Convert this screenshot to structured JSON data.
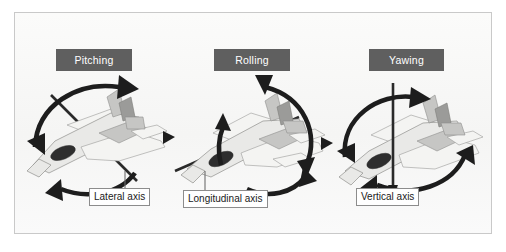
{
  "figure": {
    "kind": "aircraft-rotation-axes-diagram",
    "background_color": "#f7f7f6",
    "frame_border_color": "#c9c9c9",
    "title_box_color": "#5f5f5f",
    "title_text_color": "#ffffff",
    "arrow_color": "#1d1d1d",
    "caption_border_color": "#8c8c8c",
    "aircraft_fill": "#e9e9e7",
    "aircraft_shade": "#c6c6c4"
  },
  "panels": [
    {
      "id": "pitching",
      "title": "Pitching",
      "axis_caption": "Lateral axis",
      "aircraft_icon": "fighter-jet-icon",
      "rotation_arrows": 2,
      "axis_orientation": "lateral-wingtip-to-wingtip"
    },
    {
      "id": "rolling",
      "title": "Rolling",
      "axis_caption": "Longitudinal axis",
      "aircraft_icon": "fighter-jet-icon",
      "rotation_arrows": 2,
      "axis_orientation": "longitudinal-nose-to-tail"
    },
    {
      "id": "yawing",
      "title": "Yawing",
      "axis_caption": "Vertical axis",
      "aircraft_icon": "fighter-jet-icon",
      "rotation_arrows": 2,
      "axis_orientation": "vertical-top-to-bottom"
    }
  ]
}
